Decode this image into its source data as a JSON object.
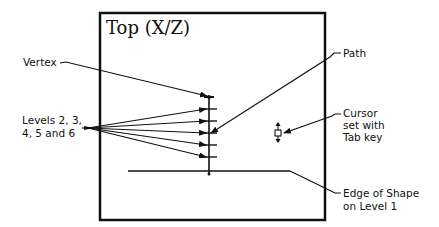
{
  "viewport": {
    "title": "Top (X/Z)"
  },
  "callouts": {
    "vertex": {
      "label": "Vertex"
    },
    "levels": {
      "line1": "Levels 2, 3,",
      "line2": "4, 5 and 6"
    },
    "path": {
      "label": "Path"
    },
    "cursor": {
      "line1": "Cursor",
      "line2": "set with",
      "line3": "Tab key"
    },
    "edge": {
      "line1": "Edge of Shape",
      "line2": "on Level 1"
    }
  },
  "colors": {
    "stroke": "#111111",
    "background": "#ffffff"
  }
}
